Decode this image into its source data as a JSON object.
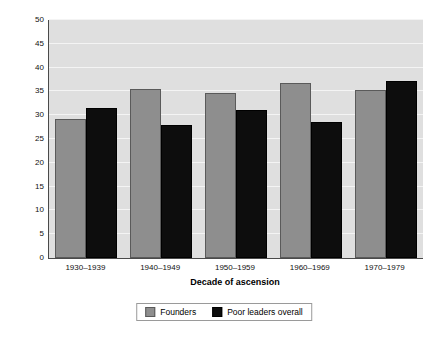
{
  "chart_data": {
    "type": "bar",
    "title": "",
    "subtitle": "",
    "xlabel": "Decade of ascension",
    "ylabel": "Percentage of all leaders",
    "categories": [
      "1930–1939",
      "1940–1949",
      "1950–1959",
      "1960–1969",
      "1970–1979"
    ],
    "series": [
      {
        "name": "Founders",
        "color": "#8e8e8e",
        "values": [
          29.3,
          35.6,
          34.6,
          36.8,
          35.4
        ]
      },
      {
        "name": "Poor leaders overall",
        "color": "#0d0d0d",
        "values": [
          31.6,
          27.9,
          31.2,
          28.5,
          37.1
        ]
      }
    ],
    "ylim": [
      0,
      50
    ],
    "ytick_step": 5,
    "yticks": [
      50,
      45,
      40,
      35,
      30,
      25,
      20,
      15,
      10,
      5,
      0
    ],
    "grid": true,
    "grid_axis": "y",
    "legend_position": "bottom-center",
    "plot_background": "#dfdfdf",
    "figure_background": "#ffffff",
    "gridline_color": "#f4f4f4",
    "axis_color": "#4a4a4a"
  },
  "legend": {
    "items": [
      {
        "label": "Founders",
        "swatch": "gray-swatch"
      },
      {
        "label": "Poor leaders overall",
        "swatch": "black-swatch"
      }
    ]
  }
}
